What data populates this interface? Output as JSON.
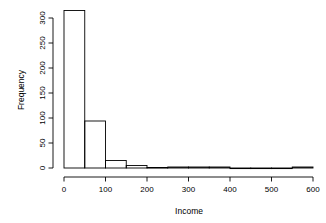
{
  "chart_data": {
    "type": "bar",
    "title": "",
    "subtitle": "",
    "xlabel": "Income",
    "ylabel": "Frequency",
    "xlim": [
      0,
      600
    ],
    "ylim": [
      0,
      315
    ],
    "grid": false,
    "legend": null,
    "binwidth": 50,
    "bin_edges": [
      0,
      50,
      100,
      150,
      200,
      250,
      300,
      350,
      400,
      450,
      500,
      550,
      600
    ],
    "categories": [
      "0-50",
      "50-100",
      "100-150",
      "150-200",
      "200-250",
      "250-300",
      "300-350",
      "350-400",
      "400-450",
      "450-500",
      "500-550",
      "550-600"
    ],
    "values": [
      315,
      94,
      15,
      5,
      1,
      2,
      2,
      2,
      0,
      0,
      0,
      2
    ],
    "xticks": [
      0,
      100,
      200,
      300,
      400,
      500,
      600
    ],
    "xtick_labels": [
      "0",
      "100",
      "200",
      "300",
      "400",
      "500",
      "600"
    ],
    "yticks": [
      0,
      50,
      100,
      150,
      200,
      250,
      300
    ],
    "ytick_labels": [
      "0",
      "50",
      "100",
      "150",
      "200",
      "250",
      "300"
    ]
  },
  "axis": {
    "x_title": "Income",
    "y_title": "Frequency"
  },
  "ticks": {
    "x": [
      "0",
      "100",
      "200",
      "300",
      "400",
      "500",
      "600"
    ],
    "y": [
      "0",
      "50",
      "100",
      "150",
      "200",
      "250",
      "300"
    ]
  }
}
